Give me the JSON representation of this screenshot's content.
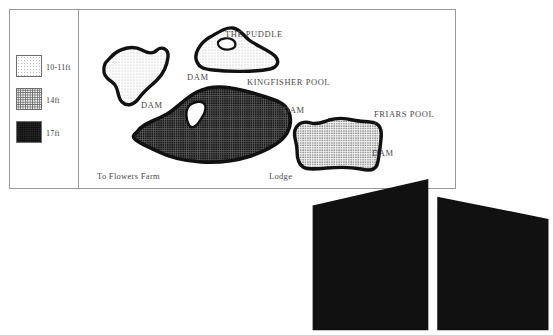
{
  "figure": {
    "border_color": "#9a9a9a"
  },
  "legend": {
    "name": "depth-legend",
    "items": [
      {
        "label": "10-11ft",
        "pattern": "light-dots",
        "swatch_name": "swatch-10-11ft"
      },
      {
        "label": "14ft",
        "pattern": "medium-dots",
        "swatch_name": "swatch-14ft"
      },
      {
        "label": "17ft",
        "pattern": "dark-dots",
        "swatch_name": "swatch-17ft"
      }
    ]
  },
  "map": {
    "pools": [
      {
        "id": "unnamed-pool",
        "label": "",
        "fill": "light-dots"
      },
      {
        "id": "the-puddle",
        "label": "THE PUDDLE",
        "fill": "light-dots"
      },
      {
        "id": "kingfisher-pool",
        "label": "KINGFISHER POOL",
        "fill": "dark-dots"
      },
      {
        "id": "friars-pool",
        "label": "FRIARS POOL",
        "fill": "medium-dots"
      }
    ],
    "dam_labels": [
      "DAM",
      "DAM",
      "DAM",
      "DAM"
    ],
    "path_label": "To Flowers Farm",
    "lodge_label": "Lodge",
    "lodge_icon": "building-icon"
  }
}
